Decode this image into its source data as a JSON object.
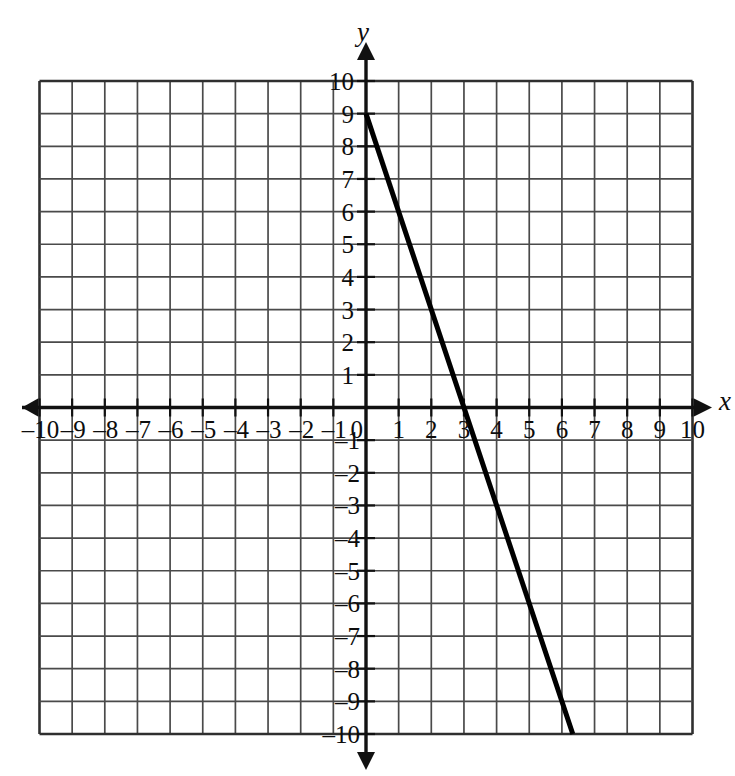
{
  "figure": {
    "kind": "cartesian-coordinate-plane",
    "background_color": "#ffffff",
    "ink_color": "#111111",
    "grid_color": "#4a4a4a",
    "axis_color": "#111111",
    "line_color": "#000000"
  },
  "axes": {
    "x_axis_name": "x",
    "y_axis_name": "y",
    "origin_label": "0",
    "x_tick_labels_negative": [
      "–10",
      "–9",
      "–8",
      "–7",
      "–6",
      "–5",
      "–4",
      "–3",
      "–2",
      "–1"
    ],
    "x_tick_labels_positive": [
      "1",
      "2",
      "3",
      "4",
      "5",
      "6",
      "7",
      "8",
      "9",
      "10"
    ],
    "y_tick_labels_positive": [
      "1",
      "2",
      "3",
      "4",
      "5",
      "6",
      "7",
      "8",
      "9",
      "10"
    ],
    "y_tick_labels_negative": [
      "–1",
      "–2",
      "–3",
      "–4",
      "–5",
      "–6",
      "–7",
      "–8",
      "–9",
      "–10"
    ]
  },
  "chart_data": {
    "type": "line",
    "title": "",
    "subtitle": "",
    "xlabel": "x",
    "ylabel": "y",
    "xlim": [
      -10,
      10
    ],
    "ylim": [
      -10,
      10
    ],
    "xticks": [
      -10,
      -9,
      -8,
      -7,
      -6,
      -5,
      -4,
      -3,
      -2,
      -1,
      0,
      1,
      2,
      3,
      4,
      5,
      6,
      7,
      8,
      9,
      10
    ],
    "yticks": [
      -10,
      -9,
      -8,
      -7,
      -6,
      -5,
      -4,
      -3,
      -2,
      -1,
      0,
      1,
      2,
      3,
      4,
      5,
      6,
      7,
      8,
      9,
      10
    ],
    "xtick_labels": [
      "–10",
      "–9",
      "–8",
      "–7",
      "–6",
      "–5",
      "–4",
      "–3",
      "–2",
      "–1",
      "0",
      "1",
      "2",
      "3",
      "4",
      "5",
      "6",
      "7",
      "8",
      "9",
      "10"
    ],
    "ytick_labels": [
      "–10",
      "–9",
      "–8",
      "–7",
      "–6",
      "–5",
      "–4",
      "–3",
      "–2",
      "–1",
      "0",
      "1",
      "2",
      "3",
      "4",
      "5",
      "6",
      "7",
      "8",
      "9",
      "10"
    ],
    "grid": true,
    "grid_step": 1,
    "legend": false,
    "legend_position": "none",
    "annotations": [],
    "series": [
      {
        "name": "line",
        "slope": -3,
        "y_intercept": 9,
        "x_intercept": 3,
        "equation": "y = -3x + 9",
        "points": [
          {
            "x": 0,
            "y": 9
          },
          {
            "x": 1,
            "y": 6
          },
          {
            "x": 2,
            "y": 3
          },
          {
            "x": 3,
            "y": 0
          },
          {
            "x": 4,
            "y": -3
          },
          {
            "x": 5,
            "y": -6
          },
          {
            "x": 6.333,
            "y": -10
          }
        ],
        "x_start": 0,
        "y_start": 9,
        "x_end": 6.333,
        "y_end": -10
      }
    ]
  }
}
